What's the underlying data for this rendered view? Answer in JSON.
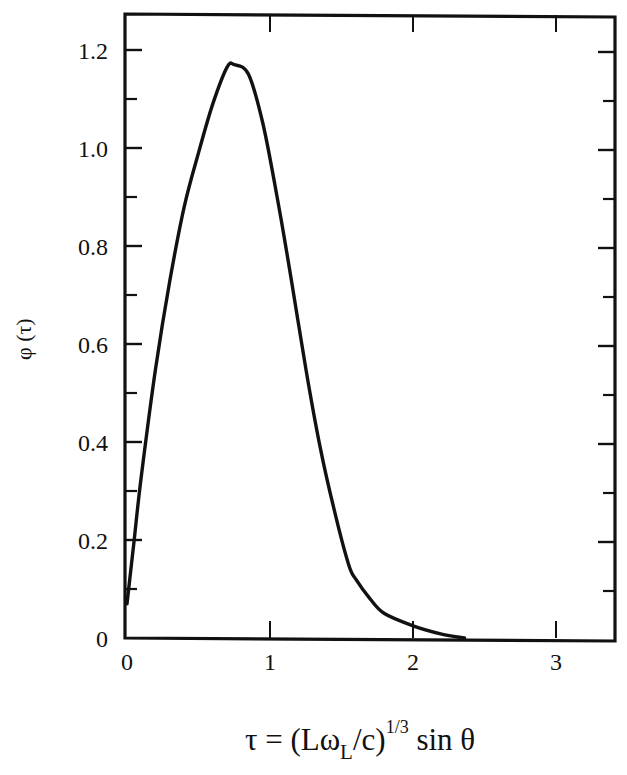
{
  "chart_data": {
    "type": "line",
    "title": "",
    "xlabel": "τ = (Lω_L/c)^(1/3) sin θ",
    "ylabel": "φ (τ)",
    "xlim": [
      0,
      3.41
    ],
    "ylim": [
      0,
      1.27
    ],
    "x_ticks": [
      0,
      1,
      2,
      3
    ],
    "x_tick_labels": [
      "0",
      "1",
      "2",
      "3"
    ],
    "y_ticks": [
      0,
      0.2,
      0.4,
      0.6,
      0.8,
      1.0,
      1.2
    ],
    "y_tick_labels": [
      "0",
      "0.2",
      "0.4",
      "0.6",
      "0.8",
      "1.0",
      "1.2"
    ],
    "y_minor_ticks": [
      0.1,
      0.3,
      0.5,
      0.7,
      0.9,
      1.1
    ],
    "grid": false,
    "legend": null,
    "series": [
      {
        "name": "φ(τ)",
        "color": "#111111",
        "x": [
          0.0,
          0.05,
          0.1,
          0.2,
          0.3,
          0.4,
          0.5,
          0.6,
          0.7,
          0.75,
          0.85,
          0.95,
          1.05,
          1.15,
          1.25,
          1.35,
          1.45,
          1.55,
          1.6,
          1.7,
          1.8,
          2.0,
          2.2,
          2.36
        ],
        "y": [
          0.07,
          0.2,
          0.33,
          0.55,
          0.73,
          0.88,
          0.99,
          1.09,
          1.165,
          1.17,
          1.15,
          1.05,
          0.9,
          0.73,
          0.55,
          0.39,
          0.26,
          0.15,
          0.12,
          0.08,
          0.05,
          0.025,
          0.008,
          0.0
        ]
      }
    ]
  },
  "labels": {
    "ylabel_text": "φ (τ)",
    "xlabel_prefix": "τ = (Lω",
    "xlabel_sub": "L",
    "xlabel_mid": "/c)",
    "xlabel_sup": "1/3",
    "xlabel_suffix": "sin θ"
  },
  "style": {
    "line_color": "#111111",
    "axis_color": "#111111",
    "background": "#ffffff"
  }
}
